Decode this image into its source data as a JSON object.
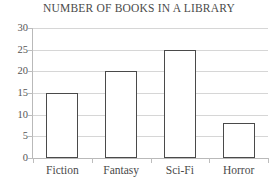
{
  "chart_data": {
    "type": "bar",
    "title": "NUMBER OF BOOKS IN A LIBRARY",
    "xlabel": "",
    "ylabel": "",
    "categories": [
      "Fiction",
      "Fantasy",
      "Sci-Fi",
      "Horror"
    ],
    "values": [
      15,
      20,
      25,
      8
    ],
    "ylim": [
      0,
      30
    ],
    "ytick_step": 5,
    "yticks": [
      0,
      5,
      10,
      15,
      20,
      25,
      30
    ],
    "ytick_labels": [
      "0",
      "5",
      "10",
      "15",
      "20",
      "25",
      "30"
    ],
    "grid": true,
    "legend": false,
    "colors": {
      "bar_fill": "#ffffff",
      "bar_edge": "#4a4a4a",
      "gridline": "#d6d6d6",
      "axis": "#b9b9b9",
      "text": "#4a4a4a",
      "background": "#ffffff"
    }
  }
}
